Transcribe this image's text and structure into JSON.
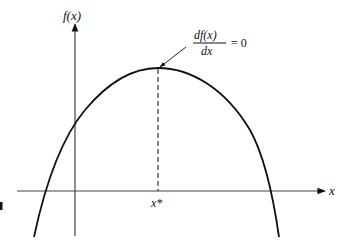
{
  "figure": {
    "type": "function-maximum-diagram",
    "y_axis_label": "f(x)",
    "x_axis_label": "x",
    "critical_point_label": "x*",
    "annotation": {
      "numerator": "df(x)",
      "denominator": "dx",
      "equals": "= 0"
    },
    "colors": {
      "curve": "#111111",
      "axes": "#444444",
      "background": "#ffffff"
    }
  }
}
